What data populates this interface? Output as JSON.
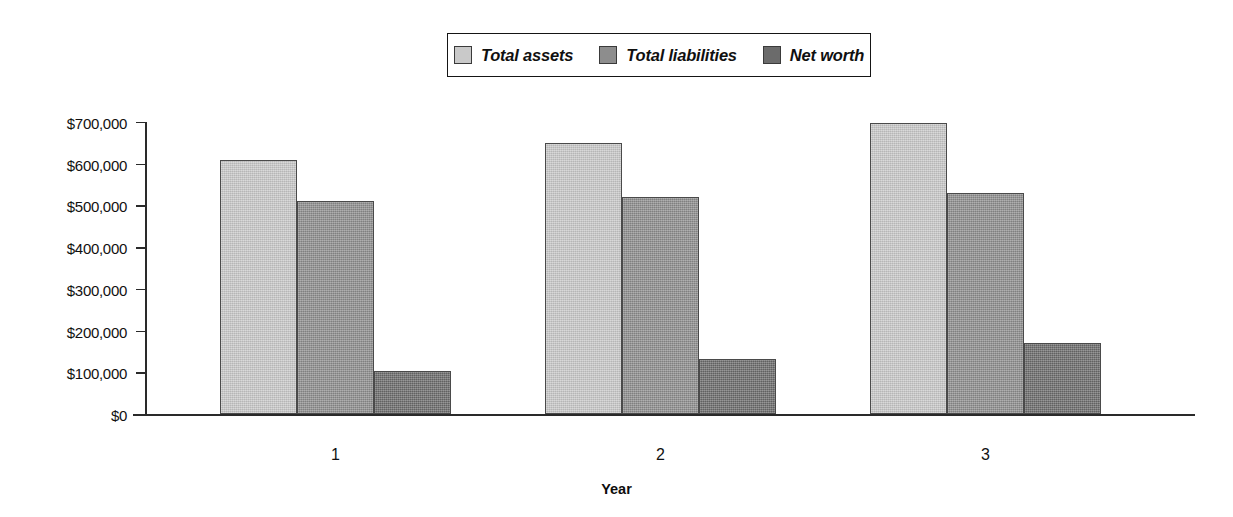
{
  "chart_data": {
    "type": "bar",
    "title": "",
    "xlabel": "Year",
    "ylabel": "",
    "categories": [
      "1",
      "2",
      "3"
    ],
    "series": [
      {
        "name": "Total assets",
        "color": "#c9c9c9",
        "values": [
          610000,
          650000,
          697000
        ]
      },
      {
        "name": "Total liabilities",
        "color": "#8d8d8d",
        "values": [
          510000,
          520000,
          530000
        ]
      },
      {
        "name": "Net worth",
        "color": "#6b6b6b",
        "values": [
          103000,
          133000,
          170000
        ]
      }
    ],
    "ylim": [
      0,
      700000
    ],
    "ytick_values": [
      0,
      100000,
      200000,
      300000,
      400000,
      500000,
      600000,
      700000
    ],
    "ytick_labels": [
      "$0",
      "$100,000",
      "$200,000",
      "$300,000",
      "$400,000",
      "$500,000",
      "$600,000",
      "$700,000"
    ],
    "grid": false,
    "legend_position": "top-center"
  }
}
